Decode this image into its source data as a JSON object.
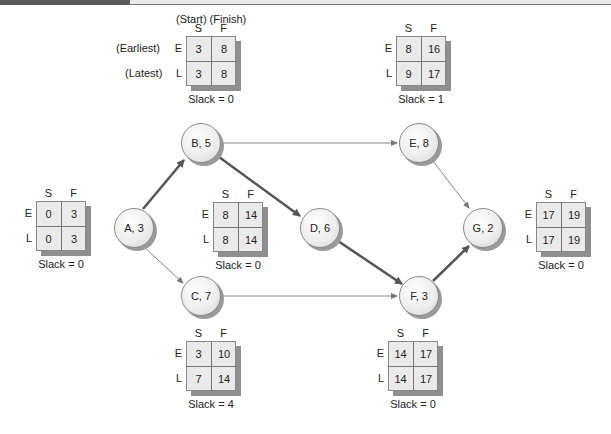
{
  "legend": {
    "column_caption": "(Start) (Finish)",
    "earliest_label": "(Earliest)",
    "latest_label": "(Latest)"
  },
  "colors": {
    "critical_edge": "#555555",
    "normal_edge": "#888888",
    "grid_fill": "#eaeaea",
    "grid_shadow": "#8f8f8f",
    "node_fill": "#eeeeee"
  },
  "nodes": [
    {
      "id": "A",
      "label": "A, 3",
      "duration": 3
    },
    {
      "id": "B",
      "label": "B, 5",
      "duration": 5
    },
    {
      "id": "C",
      "label": "C, 7",
      "duration": 7
    },
    {
      "id": "D",
      "label": "D, 6",
      "duration": 6
    },
    {
      "id": "E",
      "label": "E, 8",
      "duration": 8
    },
    {
      "id": "F",
      "label": "F, 3",
      "duration": 3
    },
    {
      "id": "G",
      "label": "G, 2",
      "duration": 2
    }
  ],
  "edges": [
    {
      "from": "A",
      "to": "B",
      "critical": true
    },
    {
      "from": "A",
      "to": "C",
      "critical": false
    },
    {
      "from": "B",
      "to": "D",
      "critical": true
    },
    {
      "from": "B",
      "to": "E",
      "critical": false
    },
    {
      "from": "C",
      "to": "F",
      "critical": false
    },
    {
      "from": "D",
      "to": "F",
      "critical": true
    },
    {
      "from": "E",
      "to": "G",
      "critical": false
    },
    {
      "from": "F",
      "to": "G",
      "critical": true
    }
  ],
  "grids": {
    "A": {
      "col_s": "S",
      "col_f": "F",
      "row_e": "E",
      "row_l": "L",
      "es": "0",
      "ef": "3",
      "ls": "0",
      "lf": "3",
      "slack": "Slack = 0"
    },
    "B": {
      "col_s": "S",
      "col_f": "F",
      "row_e": "E",
      "row_l": "L",
      "es": "3",
      "ef": "8",
      "ls": "3",
      "lf": "8",
      "slack": "Slack = 0"
    },
    "C": {
      "col_s": "S",
      "col_f": "F",
      "row_e": "E",
      "row_l": "L",
      "es": "3",
      "ef": "10",
      "ls": "7",
      "lf": "14",
      "slack": "Slack = 4"
    },
    "D": {
      "col_s": "S",
      "col_f": "F",
      "row_e": "E",
      "row_l": "L",
      "es": "8",
      "ef": "14",
      "ls": "8",
      "lf": "14",
      "slack": "Slack = 0"
    },
    "E": {
      "col_s": "S",
      "col_f": "F",
      "row_e": "E",
      "row_l": "L",
      "es": "8",
      "ef": "16",
      "ls": "9",
      "lf": "17",
      "slack": "Slack = 1"
    },
    "F": {
      "col_s": "S",
      "col_f": "F",
      "row_e": "E",
      "row_l": "L",
      "es": "14",
      "ef": "17",
      "ls": "14",
      "lf": "17",
      "slack": "Slack = 0"
    },
    "G": {
      "col_s": "S",
      "col_f": "F",
      "row_e": "E",
      "row_l": "L",
      "es": "17",
      "ef": "19",
      "ls": "17",
      "lf": "19",
      "slack": "Slack = 0"
    }
  }
}
